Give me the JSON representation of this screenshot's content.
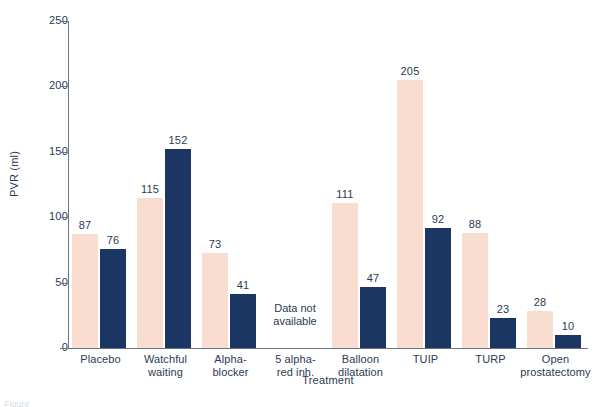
{
  "chart_data": {
    "type": "bar",
    "title": "",
    "xlabel": "Treatment",
    "ylabel": "PVR (ml)",
    "ylim": [
      0,
      250
    ],
    "yticks": [
      0,
      50,
      100,
      150,
      200,
      250
    ],
    "grid": false,
    "legend": "none",
    "categories": [
      "Placebo",
      "Watchful waiting",
      "Alpha-blocker",
      "5 alpha-red inh.",
      "Balloon dilatation",
      "TUIP",
      "TURP",
      "Open prostatectomy"
    ],
    "category_label_lines": [
      [
        "Placebo"
      ],
      [
        "Watchful",
        "waiting"
      ],
      [
        "Alpha-",
        "blocker"
      ],
      [
        "5 alpha-",
        "red inh."
      ],
      [
        "Balloon",
        "dilatation"
      ],
      [
        "TUIP"
      ],
      [
        "TURP"
      ],
      [
        "Open",
        "prostatectomy"
      ]
    ],
    "series": [
      {
        "name": "series-a",
        "color": "#f8ddd0",
        "values": [
          87,
          115,
          73,
          null,
          111,
          205,
          88,
          28
        ]
      },
      {
        "name": "series-b",
        "color": "#1c3663",
        "values": [
          76,
          152,
          41,
          null,
          47,
          92,
          23,
          10
        ]
      }
    ],
    "annotations": [
      {
        "category": "5 alpha-red inh.",
        "lines": [
          "Data not",
          "available"
        ]
      }
    ]
  },
  "axis": {
    "y_tick_labels": [
      "0",
      "50",
      "100",
      "150",
      "200",
      "250"
    ],
    "y_title": "PVR (ml)",
    "x_title": "Treatment"
  },
  "bar_value_labels": {
    "a": [
      "87",
      "115",
      "73",
      "",
      "111",
      "205",
      "88",
      "28"
    ],
    "b": [
      "76",
      "152",
      "41",
      "",
      "47",
      "92",
      "23",
      "10"
    ]
  },
  "annotation": {
    "na_line1": "Data not",
    "na_line2": "available"
  },
  "caption": {
    "text": "Figure"
  },
  "colors": {
    "series_a": "#f8ddd0",
    "series_b": "#1c3663",
    "axis": "#6b7488",
    "text": "#2b3a55",
    "background": "#ffffff"
  }
}
